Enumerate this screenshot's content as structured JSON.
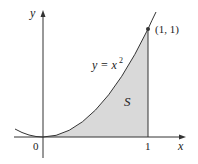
{
  "diagram": {
    "type": "region-under-curve",
    "curve_label": "y = x",
    "curve_exponent": "2",
    "region_label": "S",
    "point_label": "(1, 1)",
    "axes": {
      "x_label": "x",
      "y_label": "y",
      "x_ticks": [
        "0",
        "1"
      ]
    },
    "colors": {
      "fill": "#d9d9d9",
      "stroke": "#333333",
      "background": "#ffffff"
    }
  }
}
